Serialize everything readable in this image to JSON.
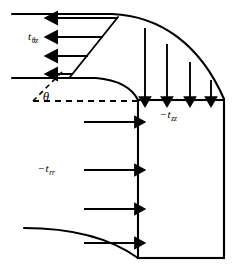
{
  "figure": {
    "background_color": "#ffffff",
    "stroke_color": "#000000",
    "width": 233,
    "height": 276
  },
  "labels": {
    "theta": {
      "text": "θ",
      "name": "angle-theta",
      "x": 46,
      "y": 101
    },
    "t_theta_z": {
      "minus": "",
      "symbol": "t",
      "subscript": "θz",
      "full": "tθz",
      "x": 28,
      "y": 40
    },
    "t_zz": {
      "minus": "−",
      "symbol": "t",
      "subscript": "zz",
      "full": "−tzz",
      "x": 160,
      "y": 118
    },
    "t_rr": {
      "minus": "−",
      "symbol": "t",
      "subscript": "rr",
      "full": "−trr",
      "x": 38,
      "y": 172
    }
  },
  "control_volume": {
    "name": "control-volume-box",
    "left": 138,
    "top": 100,
    "right": 224,
    "bottom": 258,
    "fill": "none",
    "stroke": "#000000"
  },
  "arrows": {
    "t_zz_down": {
      "name": "stress-arrow-tzz",
      "direction": "down",
      "count": 4,
      "items": [
        {
          "x": 145,
          "y_start": 28,
          "y_end": 99
        },
        {
          "x": 167,
          "y_start": 44,
          "y_end": 99
        },
        {
          "x": 190,
          "y_start": 62,
          "y_end": 99
        },
        {
          "x": 211,
          "y_start": 80,
          "y_end": 99
        }
      ]
    },
    "t_rr_right": {
      "name": "stress-arrow-trr",
      "direction": "right",
      "count": 4,
      "items": [
        {
          "y": 122,
          "x_start": 84,
          "x_end": 137
        },
        {
          "y": 170,
          "x_start": 84,
          "x_end": 137
        },
        {
          "y": 209,
          "x_start": 84,
          "x_end": 137
        },
        {
          "y": 243,
          "x_start": 84,
          "x_end": 137
        }
      ]
    },
    "t_theta_z_left": {
      "name": "stress-arrow-ttheta-z",
      "direction": "left",
      "count": 4,
      "items": [
        {
          "y": 18,
          "x_start": 118,
          "x_end": 55
        },
        {
          "y": 37,
          "x_start": 103,
          "x_end": 55
        },
        {
          "y": 56,
          "x_start": 88,
          "x_end": 55
        },
        {
          "y": 74,
          "x_start": 73,
          "x_end": 55
        }
      ]
    }
  },
  "curves": {
    "top_streamline": {
      "name": "streamline-top",
      "description": "upper boundary curve sweeping right and down to box top-right",
      "path": "M 12 14 L 112 14 C 160 16 200 44 224 99"
    },
    "mid_streamline": {
      "name": "streamline-middle",
      "description": "second boundary line curving down to box top-left corner",
      "path": "M 12 78 L 96 78 C 118 80 132 88 138 100"
    },
    "bottom_streamline": {
      "name": "streamline-bottom",
      "description": "lower boundary curve arriving at box bottom-left corner",
      "path": "M 24 228 C 72 228 110 238 138 258"
    },
    "envelope_profile": {
      "name": "velocity-profile-envelope",
      "description": "slanted line joining the tails of the leftward arrows",
      "path": "M 118 17 L 70 77"
    }
  },
  "dashed_lines": {
    "horizontal_ray": {
      "name": "dashed-horizontal-ray",
      "path": "M 33 101 L 138 101",
      "dash": "6 5"
    },
    "angle_ray": {
      "name": "dashed-angle-ray",
      "path": "M 33 101 L 62 72",
      "dash": "5 4"
    }
  }
}
